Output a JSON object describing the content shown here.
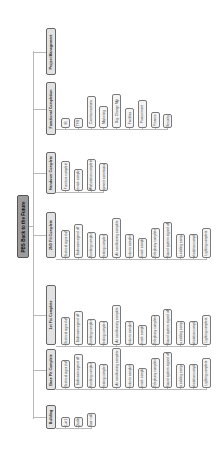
{
  "root": {
    "label": "PBS Back to the Future"
  },
  "branches": [
    {
      "label": "Project Management",
      "children": []
    },
    {
      "label": "Functional Completion",
      "children": [
        "IR",
        "TFS",
        "Communications",
        "Marketing",
        "Org. Change Mgt",
        "Facilities",
        "Procurement",
        "Finance",
        "Security"
      ]
    },
    {
      "label": "Handover Complete",
      "children": [
        "Furniture complete",
        "Network complete",
        "Workstation complete",
        "Equipment commissioned"
      ]
    },
    {
      "label": "2ND Fit Complete",
      "children": [
        "Electrical signed off",
        "Bathroom signed off",
        "Plumbing complete",
        "Heating complete",
        "Air conditioning complete",
        "Fixtures complete",
        "Network complete",
        "Telephony complete",
        "Sound system signed off",
        "Data cabling complete",
        "Workstation complete",
        "Lighting complete"
      ]
    },
    {
      "label": "1st Fix Complete",
      "children": [
        "Electrical signed off",
        "Bathroom signed off",
        "Plumbing complete",
        "Heating complete",
        "Air conditioning complete",
        "Fixtures complete",
        "Network complete",
        "Telephony complete",
        "Sound system signed off",
        "Data cabling complete",
        "Workstation complete",
        "Lighting complete"
      ]
    },
    {
      "label": "Base Pit Complete",
      "children": [
        "Electrical signed off",
        "Bathroom signed off",
        "Plumbing complete",
        "Heating complete",
        "Air conditioning complete",
        "Fixtures complete",
        "Network complete",
        "Telephony complete",
        "Sound system signed off",
        "Data cabling complete",
        "Workstation complete",
        "Lighting complete"
      ]
    },
    {
      "label": "Building",
      "children": [
        "Lot 1",
        "Quality",
        "Floor walls"
      ]
    }
  ]
}
